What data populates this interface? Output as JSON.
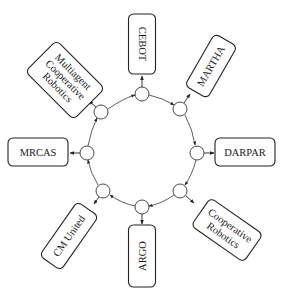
{
  "diagram": {
    "type": "ring-network",
    "center": {
      "x": 141,
      "y": 152
    },
    "ring_radius": 58,
    "direction": "clockwise",
    "colors": {
      "stroke": "#222222",
      "fill": "#ffffff",
      "text": "#1a1a1a"
    },
    "nodes": [
      {
        "id": "cebot",
        "label": "CEBOT"
      },
      {
        "id": "martha",
        "label": "MARTHA"
      },
      {
        "id": "darpar",
        "label": "DARPAR"
      },
      {
        "id": "cooperative-robotics",
        "label_lines": [
          "Cooperative",
          "Robotics"
        ]
      },
      {
        "id": "argo",
        "label": "ARGO"
      },
      {
        "id": "cm-united",
        "label": "CM United"
      },
      {
        "id": "mrcas",
        "label": "MRCAS"
      },
      {
        "id": "multiagent-cooperative-robotics",
        "label_lines": [
          "Multiagent",
          "Cooperative",
          "Robotics"
        ]
      }
    ]
  }
}
